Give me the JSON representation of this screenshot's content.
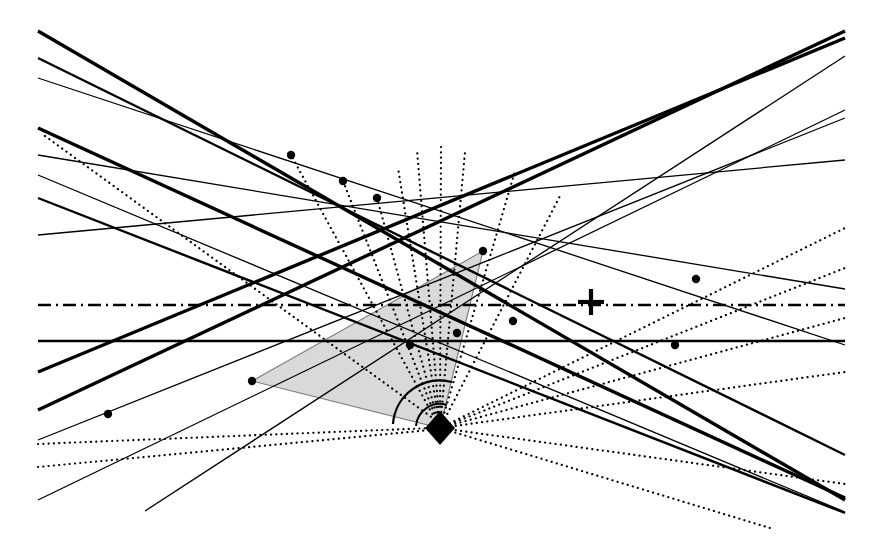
{
  "figure": {
    "title": "Line arrangement with shaded triangle, dotted pencil of rays, apex marker and angle arc",
    "kind": "geometric-diagram",
    "width": 881,
    "height": 550,
    "background_color": "#ffffff",
    "ink_color": "#000000",
    "shade_fill_color": "#d9d9d9",
    "shade_stroke_color": "#7a7a7a"
  },
  "chart_data": {
    "type": "scatter",
    "xlabel": "",
    "ylabel": "",
    "xlim": [
      0,
      881
    ],
    "ylim": [
      0,
      550
    ],
    "grid": false,
    "legend": "none",
    "annotations": [
      "apex diamond marker at (440, 428)",
      "plus/cross marker at (591, 302) on dash-dot horizontal line",
      "angle arc centered on apex, radius 47",
      "shaded triangle vertices (252, 381), (483, 251), (440, 428)"
    ]
  },
  "strokes": {
    "thick_width": 3.4,
    "medium_width": 2.4,
    "thin_width": 1.3,
    "dotted_width": 2.2,
    "dotted_dasharray": "0.1 5.2",
    "dashdot_dasharray": "13 5 2 5",
    "shade_border_width": 1.1
  },
  "markers": {
    "dot_radius": 4.2,
    "diamond_half_width": 15,
    "diamond_half_height": 17,
    "cross_arm_half": 13,
    "cross_width": 4.2,
    "arc_radius": 47,
    "arc_width": 2.3,
    "inner_arc_radius": 24,
    "inner_arc_width": 2.0
  },
  "shaded_polygon": {
    "name": "shaded-triangle",
    "points": "252,381 483,251 440,428"
  },
  "angle_arc": {
    "name": "angle-arc",
    "center_x": 440,
    "center_y": 428,
    "start_x": 393,
    "start_y": 424,
    "end_x": 452,
    "end_y": 382,
    "sweep": 1
  },
  "inner_angle_arc": {
    "name": "inner-angle-arc",
    "center_x": 440,
    "center_y": 428,
    "start_x": 416,
    "start_y": 426,
    "end_x": 447,
    "end_y": 405,
    "sweep": 1
  },
  "solid_lines": [
    {
      "name": "line-thick-main-descending",
      "x1": 38,
      "y1": 31,
      "x2": 845,
      "y2": 500,
      "weight": "thick"
    },
    {
      "name": "line-medium-upper-left-a",
      "x1": 38,
      "y1": 58,
      "x2": 845,
      "y2": 455,
      "weight": "medium"
    },
    {
      "name": "line-thin-upper-left-b",
      "x1": 38,
      "y1": 78,
      "x2": 845,
      "y2": 345,
      "weight": "thin"
    },
    {
      "name": "line-thick-second-descending",
      "x1": 38,
      "y1": 128,
      "x2": 845,
      "y2": 498,
      "weight": "thick"
    },
    {
      "name": "line-thin-shallow-a",
      "x1": 38,
      "y1": 155,
      "x2": 845,
      "y2": 289,
      "weight": "thin"
    },
    {
      "name": "line-medium-descending-c",
      "x1": 38,
      "y1": 198,
      "x2": 845,
      "y2": 513,
      "weight": "medium"
    },
    {
      "name": "line-thin-shallow-b",
      "x1": 38,
      "y1": 235,
      "x2": 845,
      "y2": 160,
      "weight": "thin"
    },
    {
      "name": "line-horizontal-solid",
      "x1": 38,
      "y1": 341,
      "x2": 845,
      "y2": 341,
      "weight": "medium"
    },
    {
      "name": "line-thick-ascending-a",
      "x1": 38,
      "y1": 372,
      "x2": 845,
      "y2": 38,
      "weight": "thick"
    },
    {
      "name": "line-thick-ascending-b",
      "x1": 38,
      "y1": 410,
      "x2": 845,
      "y2": 31,
      "weight": "thick"
    },
    {
      "name": "line-thin-ascending-c",
      "x1": 38,
      "y1": 500,
      "x2": 845,
      "y2": 110,
      "weight": "thin"
    },
    {
      "name": "line-thin-ascending-d",
      "x1": 38,
      "y1": 440,
      "x2": 845,
      "y2": 118,
      "weight": "thin"
    },
    {
      "name": "line-thin-ascending-e",
      "x1": 145,
      "y1": 511,
      "x2": 845,
      "y2": 56,
      "weight": "thin"
    },
    {
      "name": "line-thin-descending-right",
      "x1": 38,
      "y1": 175,
      "x2": 845,
      "y2": 512,
      "weight": "thin"
    }
  ],
  "dashdot_lines": [
    {
      "name": "line-dashdot-horizontal",
      "x1": 38,
      "y1": 305,
      "x2": 845,
      "y2": 305
    }
  ],
  "dotted_lines": [
    {
      "name": "dotted-diagonal-upper-left",
      "x1": 45,
      "y1": 136,
      "x2": 452,
      "y2": 432
    },
    {
      "name": "dotted-shallow-lower-left",
      "x1": 38,
      "y1": 467,
      "x2": 430,
      "y2": 430
    },
    {
      "name": "dotted-shallow-lower-left-2",
      "x1": 38,
      "y1": 444,
      "x2": 432,
      "y2": 428
    }
  ],
  "pencil_rays": {
    "name": "dotted-ray-pencil",
    "apex_x": 440,
    "apex_y": 428,
    "rays": [
      {
        "name": "ray-to-upper-left-1",
        "x2": 291,
        "y2": 155
      },
      {
        "name": "ray-to-upper-left-2",
        "x2": 343,
        "y2": 181
      },
      {
        "name": "ray-to-upper-left-3",
        "x2": 377,
        "y2": 198
      },
      {
        "name": "ray-to-upper-left-4",
        "x2": 398,
        "y2": 168
      },
      {
        "name": "ray-to-upper-left-5",
        "x2": 417,
        "y2": 150
      },
      {
        "name": "ray-to-up-1",
        "x2": 441,
        "y2": 143
      },
      {
        "name": "ray-to-up-2",
        "x2": 465,
        "y2": 152
      },
      {
        "name": "ray-to-upper-right-1",
        "x2": 515,
        "y2": 171
      },
      {
        "name": "ray-to-upper-right-2",
        "x2": 560,
        "y2": 196
      },
      {
        "name": "ray-to-right-1",
        "x2": 845,
        "y2": 228
      },
      {
        "name": "ray-to-right-2",
        "x2": 845,
        "y2": 268
      },
      {
        "name": "ray-to-right-3",
        "x2": 845,
        "y2": 318
      },
      {
        "name": "ray-to-right-4",
        "x2": 845,
        "y2": 372
      },
      {
        "name": "ray-to-lower-right-1",
        "x2": 845,
        "y2": 484
      },
      {
        "name": "ray-to-lower-right-2",
        "x2": 770,
        "y2": 528
      }
    ]
  },
  "dot_markers": [
    {
      "name": "dot-on-thick-line-upper",
      "cx": 291,
      "cy": 155
    },
    {
      "name": "dot-on-thick-line-mid-a",
      "cx": 343,
      "cy": 181
    },
    {
      "name": "dot-on-thick-line-mid-b",
      "cx": 377,
      "cy": 198
    },
    {
      "name": "dot-triangle-left-vertex",
      "cx": 252,
      "cy": 381
    },
    {
      "name": "dot-triangle-top-vertex",
      "cx": 483,
      "cy": 251
    },
    {
      "name": "dot-lower-left",
      "cx": 108,
      "cy": 414
    },
    {
      "name": "dot-on-horizontal-a",
      "cx": 410,
      "cy": 345
    },
    {
      "name": "dot-on-horizontal-b",
      "cx": 457,
      "cy": 333
    },
    {
      "name": "dot-on-horizontal-c",
      "cx": 513,
      "cy": 321
    },
    {
      "name": "dot-right-upper",
      "cx": 696,
      "cy": 279
    },
    {
      "name": "dot-right-lower",
      "cx": 675,
      "cy": 345
    }
  ],
  "apex_marker": {
    "name": "apex-diamond-marker",
    "cx": 440,
    "cy": 428
  },
  "cross_marker": {
    "name": "cross-marker",
    "cx": 591,
    "cy": 302
  }
}
